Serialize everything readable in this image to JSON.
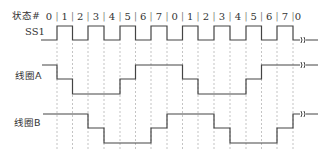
{
  "diagram": {
    "header_label": "状态#",
    "states": [
      "0",
      "1",
      "2",
      "3",
      "4",
      "5",
      "6",
      "7",
      "0",
      "1",
      "2",
      "3",
      "4",
      "5",
      "6",
      "7",
      "0"
    ],
    "boundaries_x": [
      41,
      57,
      72.5,
      88,
      104,
      120,
      135.5,
      151,
      167,
      182.5,
      198,
      214,
      230,
      246,
      261.5,
      277,
      293,
      309
    ],
    "signals": [
      {
        "name": "SS1",
        "label_x": 25,
        "label_y": 28,
        "levels_y": {
          "high": 26,
          "low": 40
        },
        "pattern": [
          "low",
          "high",
          "low",
          "high",
          "low",
          "high",
          "low",
          "high",
          "low",
          "high",
          "low",
          "high",
          "low",
          "high",
          "low",
          "high",
          "low"
        ],
        "start_x": 41
      },
      {
        "name": "线圈A",
        "label_x": 16,
        "label_y": 71,
        "levels_y": {
          "high": 65,
          "mid": 79,
          "low": 94
        },
        "pattern": [
          "high",
          "mid",
          "low",
          "low",
          "low",
          "mid",
          "high",
          "high",
          "high",
          "mid",
          "low",
          "low",
          "low",
          "mid",
          "high",
          "high",
          "high"
        ],
        "start_x": 42
      },
      {
        "name": "线圈B",
        "label_x": 15,
        "label_y": 118,
        "levels_y": {
          "high": 114,
          "mid": 128,
          "low": 143
        },
        "pattern": [
          "high",
          "high",
          "high",
          "mid",
          "low",
          "low",
          "low",
          "mid",
          "high",
          "high",
          "high",
          "mid",
          "low",
          "low",
          "low",
          "mid",
          "high"
        ],
        "start_x": 43
      }
    ],
    "break_symbol": {
      "x": 300,
      "end_x": 318
    },
    "dashed_lines": {
      "y_top": 43,
      "y_bottom": 150,
      "color": "#aaaaaa"
    },
    "line_color": "#444444",
    "text_color": "#333333"
  }
}
